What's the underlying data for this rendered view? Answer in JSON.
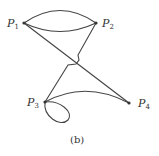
{
  "figure": {
    "caption": "(b)",
    "nodes": [
      {
        "id": "P1",
        "base": "P",
        "sub": "1",
        "x": 24,
        "y": 23
      },
      {
        "id": "P2",
        "base": "P",
        "sub": "2",
        "x": 96,
        "y": 23
      },
      {
        "id": "P3",
        "base": "P",
        "sub": "3",
        "x": 45,
        "y": 102
      },
      {
        "id": "P4",
        "base": "P",
        "sub": "4",
        "x": 129,
        "y": 103
      }
    ],
    "edges": [
      {
        "from": "P1",
        "to": "P2",
        "shape": "upper-arc"
      },
      {
        "from": "P1",
        "to": "P2",
        "shape": "lower-arc"
      },
      {
        "from": "P1",
        "to": "P4",
        "shape": "straight"
      },
      {
        "from": "P2",
        "to": "P3",
        "shape": "crossing-with-hop"
      },
      {
        "from": "P3",
        "to": "P4",
        "shape": "arc"
      },
      {
        "from": "P3",
        "to": "P3",
        "shape": "loop"
      }
    ],
    "colors": {
      "stroke": "#444444",
      "text": "#333333",
      "background": "#ffffff"
    }
  }
}
